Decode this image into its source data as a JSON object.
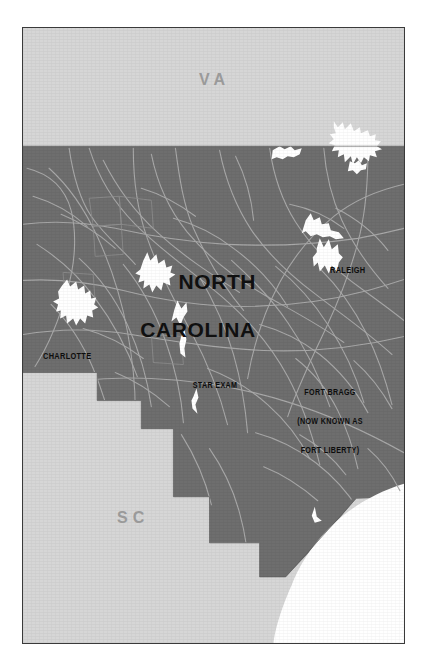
{
  "map": {
    "title_line1": "NORTH",
    "title_line2": "CAROLINA",
    "neighbors": [
      {
        "code": "VA",
        "name": "virginia"
      },
      {
        "code": "SC",
        "name": "south-carolina"
      }
    ],
    "cities": [
      {
        "name": "raleigh",
        "label": "RALEIGH"
      },
      {
        "name": "charlotte",
        "label": "CHARLOTTE"
      }
    ],
    "points_of_interest": [
      {
        "name": "star-exam",
        "lines": [
          "STAR EXAM"
        ]
      },
      {
        "name": "fort-bragg",
        "lines": [
          "FORT BRAGG",
          "(NOW KNOWN AS",
          "FORT LIBERTY)"
        ]
      }
    ],
    "colors": {
      "state_fill": "#6e6e6e",
      "neighbor_fill": "#d6d6d6",
      "water_fill": "#ffffff",
      "road_line": "#a5a5a5",
      "frame_border": "#3a3a3a",
      "page_background": "#ffffff",
      "title_text": "#101010",
      "neighbor_text": "#9a9a9a"
    }
  }
}
